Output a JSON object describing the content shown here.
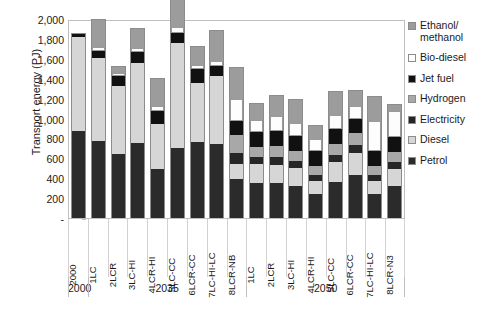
{
  "chart_data": {
    "type": "bar",
    "stacked": true,
    "title": "",
    "xlabel": "",
    "ylabel": "Transport energy (PJ)",
    "ylim": [
      0,
      2000
    ],
    "yticks": [
      "-",
      "200",
      "400",
      "600",
      "800",
      "1,000",
      "1,200",
      "1,400",
      "1,600",
      "1,800",
      "2,000"
    ],
    "grid": false,
    "legend_position": "right",
    "categories": [
      "2000",
      "1LC",
      "2LCR",
      "3LC-HI",
      "4LCR-HI",
      "5LC-CC",
      "6LCR-CC",
      "7LC-HI-LC",
      "8LCR-NB",
      "1LC",
      "2LCR",
      "3LC-HI",
      "4LCR-HI",
      "5LC-CC",
      "6LCR-CC",
      "7LC-HI-LC",
      "8LCR-N3"
    ],
    "groups": [
      {
        "label": "2000",
        "count": 1
      },
      {
        "label": "2035",
        "count": 8
      },
      {
        "label": "2050",
        "count": 8
      }
    ],
    "series": [
      {
        "name": "Petrol",
        "color": "#2b2b2b",
        "values": [
          870,
          770,
          640,
          750,
          490,
          700,
          760,
          740,
          390,
          350,
          350,
          320,
          240,
          360,
          430,
          240,
          320
        ]
      },
      {
        "name": "Diesel",
        "color": "#d6d6d6",
        "values": [
          950,
          840,
          690,
          810,
          450,
          1060,
          600,
          690,
          150,
          190,
          180,
          180,
          130,
          200,
          220,
          130,
          170
        ]
      },
      {
        "name": "Electricity",
        "color": "#262626",
        "values": [
          0,
          0,
          0,
          0,
          0,
          0,
          0,
          0,
          110,
          70,
          80,
          70,
          60,
          70,
          80,
          60,
          70
        ]
      },
      {
        "name": "Hydrogen",
        "color": "#a8a8a8",
        "values": [
          0,
          0,
          0,
          0,
          0,
          0,
          0,
          0,
          180,
          100,
          110,
          100,
          90,
          110,
          120,
          90,
          100
        ]
      },
      {
        "name": "Jet fuel",
        "color": "#111111",
        "values": [
          30,
          70,
          100,
          110,
          140,
          100,
          140,
          100,
          150,
          150,
          150,
          150,
          150,
          150,
          150,
          150,
          150
        ]
      },
      {
        "name": "Bio-diesel",
        "color": "#fdfdfd",
        "values": [
          0,
          40,
          30,
          40,
          50,
          60,
          40,
          50,
          220,
          130,
          160,
          140,
          120,
          150,
          130,
          310,
          270
        ]
      },
      {
        "name": "Ethanol/methanol",
        "color": "#9c9c9c",
        "values": [
          0,
          270,
          60,
          190,
          270,
          280,
          180,
          300,
          310,
          160,
          200,
          230,
          140,
          230,
          150,
          240,
          60
        ]
      }
    ]
  },
  "legend": {
    "items": [
      {
        "label": "Ethanol/ methanol",
        "swatch": "#9c9c9c"
      },
      {
        "label": "Bio-diesel",
        "swatch": "#fdfdfd"
      },
      {
        "label": "Jet fuel",
        "swatch": "#111111"
      },
      {
        "label": "Hydrogen",
        "swatch": "#a8a8a8"
      },
      {
        "label": "Electricity",
        "swatch": "#262626"
      },
      {
        "label": "Diesel",
        "swatch": "#d6d6d6"
      },
      {
        "label": "Petrol",
        "swatch": "#2b2b2b"
      }
    ]
  }
}
